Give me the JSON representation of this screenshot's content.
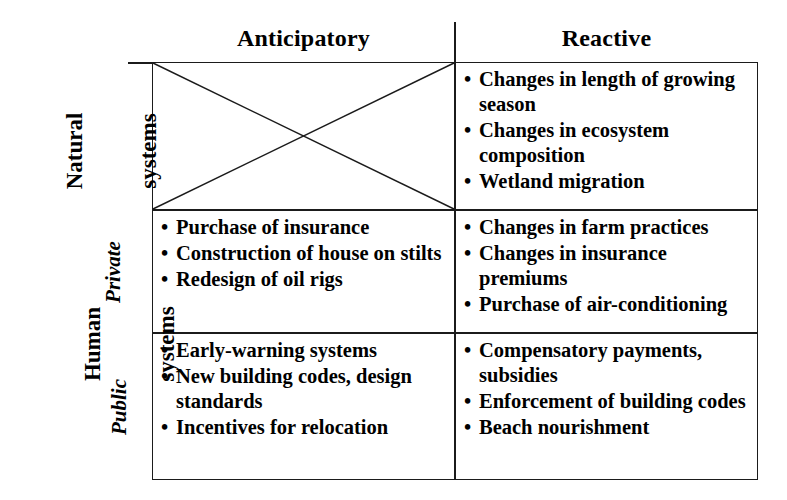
{
  "figure": {
    "kind": "two-by-three-matrix",
    "ink_color": "#1b1b1b",
    "background": "#ffffff"
  },
  "columns": [
    {
      "id": "anticipatory",
      "label": "Anticipatory"
    },
    {
      "id": "reactive",
      "label": "Reactive"
    }
  ],
  "row_groups": [
    {
      "id": "natural-systems",
      "label_line1": "Natural",
      "label_line2": "systems",
      "sub_label": ""
    },
    {
      "id": "human-systems",
      "label_line1": "Human",
      "label_line2": "systems",
      "sub_label_private": "Private",
      "sub_label_public": "Public"
    }
  ],
  "cells": {
    "natural_anticipatory": {
      "state": "crossed-out",
      "items": []
    },
    "natural_reactive": {
      "state": "filled",
      "items": [
        "Changes in length of growing season",
        "Changes in ecosystem composition",
        "Wetland migration"
      ]
    },
    "private_anticipatory": {
      "state": "filled",
      "items": [
        "Purchase of insurance",
        "Construction of house on stilts",
        "Redesign of oil rigs"
      ]
    },
    "private_reactive": {
      "state": "filled",
      "items": [
        "Changes in farm practices",
        "Changes in insurance premiums",
        "Purchase of air-conditioning"
      ]
    },
    "public_anticipatory": {
      "state": "filled",
      "items": [
        "Early-warning systems",
        "New building codes, design standards",
        "Incentives for relocation"
      ]
    },
    "public_reactive": {
      "state": "filled",
      "items": [
        "Compensatory payments, subsidies",
        "Enforcement of building codes",
        "Beach nourishment"
      ]
    }
  }
}
